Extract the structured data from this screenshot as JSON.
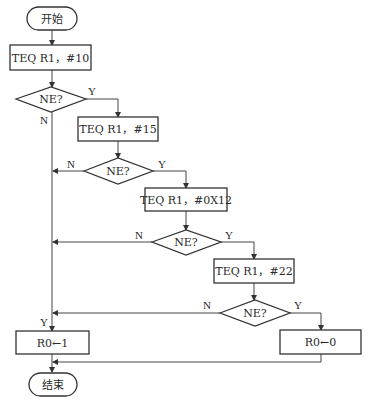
{
  "diagram": {
    "type": "flowchart",
    "nodes": {
      "start": {
        "kind": "terminator",
        "label": "开始"
      },
      "teq10": {
        "kind": "process",
        "label": "TEQ R1，#10"
      },
      "ne1": {
        "kind": "decision",
        "label": "NE?"
      },
      "teq15": {
        "kind": "process",
        "label": "TEQ R1，#15"
      },
      "ne2": {
        "kind": "decision",
        "label": "NE?"
      },
      "teq0x12": {
        "kind": "process",
        "label": "TEQ R1，#0X12"
      },
      "ne3": {
        "kind": "decision",
        "label": "NE?"
      },
      "teq22": {
        "kind": "process",
        "label": "TEQ R1，#22"
      },
      "ne4": {
        "kind": "decision",
        "label": "NE?"
      },
      "r0_1": {
        "kind": "process",
        "label": "R0←1"
      },
      "r0_0": {
        "kind": "process",
        "label": "R0←0"
      },
      "end": {
        "kind": "terminator",
        "label": "结束"
      }
    },
    "edge_labels": {
      "ne1_yes": "Y",
      "ne1_no": "N",
      "ne2_yes": "Y",
      "ne2_no": "N",
      "ne3_yes": "Y",
      "ne3_no": "N",
      "ne4_yes": "Y",
      "ne4_no": "N",
      "r0_1_in": "Y"
    },
    "edges": [
      {
        "from": "start",
        "to": "teq10"
      },
      {
        "from": "teq10",
        "to": "ne1"
      },
      {
        "from": "ne1",
        "to": "teq15",
        "label": "Y"
      },
      {
        "from": "ne1",
        "to": "r0_1",
        "label": "N"
      },
      {
        "from": "teq15",
        "to": "ne2"
      },
      {
        "from": "ne2",
        "to": "teq0x12",
        "label": "Y"
      },
      {
        "from": "ne2",
        "to": "r0_1",
        "label": "N"
      },
      {
        "from": "teq0x12",
        "to": "ne3"
      },
      {
        "from": "ne3",
        "to": "teq22",
        "label": "Y"
      },
      {
        "from": "ne3",
        "to": "r0_1",
        "label": "N"
      },
      {
        "from": "teq22",
        "to": "ne4"
      },
      {
        "from": "ne4",
        "to": "r0_0",
        "label": "Y"
      },
      {
        "from": "ne4",
        "to": "r0_1",
        "label": "N"
      },
      {
        "from": "r0_1",
        "to": "end"
      },
      {
        "from": "r0_0",
        "to": "end"
      }
    ],
    "colors": {
      "stroke": "#333333",
      "fill": "#ffffff",
      "text": "#2a2a2a"
    }
  }
}
